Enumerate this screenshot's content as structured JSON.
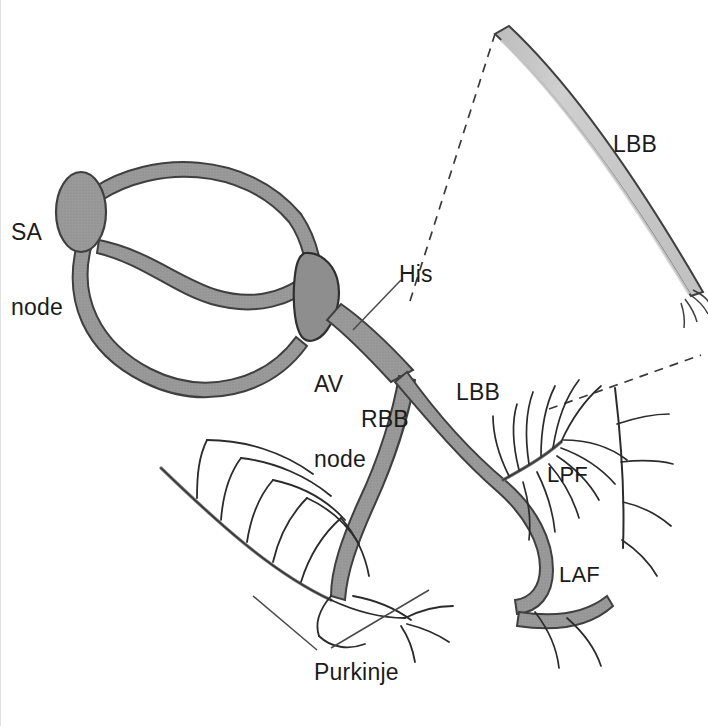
{
  "figure": {
    "width": 708,
    "height": 726,
    "background": "#ffffff",
    "border_color": "#e2e2e2"
  },
  "palette": {
    "node_fill": "#969696",
    "tract_fill": "#9a9a9a",
    "inset_band_fill": "#c8c8c8",
    "outline": "#3a3a3a",
    "fiber_stroke": "#2b2b2b",
    "leader_stroke": "#4a4a4a",
    "dashed_stroke": "#3a3a3a",
    "text_color": "#1b1b1b"
  },
  "labels": [
    {
      "id": "sa-node",
      "text": "SA\nnode",
      "line1": "SA",
      "line2": "node",
      "x": 10,
      "y": 170,
      "anchor": "left"
    },
    {
      "id": "av-node",
      "text": "AV\nnode",
      "line1": "AV",
      "line2": "node",
      "x": 313,
      "y": 322,
      "anchor": "left"
    },
    {
      "id": "his",
      "text": "His",
      "line1": "His",
      "line2": "",
      "x": 398,
      "y": 262,
      "anchor": "left"
    },
    {
      "id": "rbb",
      "text": "RBB",
      "line1": "RBB",
      "line2": "",
      "x": 360,
      "y": 407,
      "anchor": "left"
    },
    {
      "id": "lbb-main",
      "text": "LBB",
      "line1": "LBB",
      "line2": "",
      "x": 455,
      "y": 380,
      "anchor": "left"
    },
    {
      "id": "lbb-inset",
      "text": "LBB",
      "line1": "LBB",
      "line2": "",
      "x": 612,
      "y": 132,
      "anchor": "left"
    },
    {
      "id": "lpf",
      "text": "LPF",
      "line1": "LPF",
      "line2": "",
      "x": 546,
      "y": 462,
      "anchor": "left"
    },
    {
      "id": "laf",
      "text": "LAF",
      "line1": "LAF",
      "line2": "",
      "x": 558,
      "y": 562,
      "anchor": "left"
    },
    {
      "id": "purkinje",
      "text": "Purkinje",
      "line1": "Purkinje",
      "line2": "",
      "x": 313,
      "y": 660,
      "anchor": "left"
    }
  ],
  "structures": [
    {
      "id": "sa-node-body",
      "name": "SA node",
      "kind": "node-oval"
    },
    {
      "id": "av-node-body",
      "name": "AV node",
      "kind": "node-wedge"
    },
    {
      "id": "internodal-upper",
      "name": "upper internodal tract",
      "kind": "tract"
    },
    {
      "id": "bachmann-sigmoid",
      "name": "sigmoid internodal tract",
      "kind": "tract"
    },
    {
      "id": "internodal-lower",
      "name": "lower internodal loop",
      "kind": "tract"
    },
    {
      "id": "his-bundle",
      "name": "bundle of His",
      "kind": "tract"
    },
    {
      "id": "right-bundle-branch",
      "name": "right bundle branch",
      "kind": "tract"
    },
    {
      "id": "left-bundle-branch",
      "name": "left bundle branch",
      "kind": "tract"
    },
    {
      "id": "lpf-fascicle",
      "name": "left posterior fascicle",
      "kind": "fascicle"
    },
    {
      "id": "laf-fascicle",
      "name": "left anterior fascicle",
      "kind": "fascicle"
    },
    {
      "id": "purkinje-right",
      "name": "right Purkinje network",
      "kind": "fiber-network"
    },
    {
      "id": "purkinje-left",
      "name": "left Purkinje network",
      "kind": "fiber-network"
    },
    {
      "id": "lbb-magnified-band",
      "name": "magnified left bundle branch",
      "kind": "inset-band"
    },
    {
      "id": "magnifier-dashed",
      "name": "magnification callout lines",
      "kind": "dashed-callout"
    }
  ],
  "leader_lines": [
    {
      "id": "his-leader",
      "from": "his-label",
      "to": "his-bundle"
    },
    {
      "id": "purkinje-leader-a",
      "from": "purkinje-label",
      "to": "purkinje-right-upper"
    },
    {
      "id": "purkinje-leader-b",
      "from": "purkinje-label",
      "to": "purkinje-right-lower"
    }
  ]
}
